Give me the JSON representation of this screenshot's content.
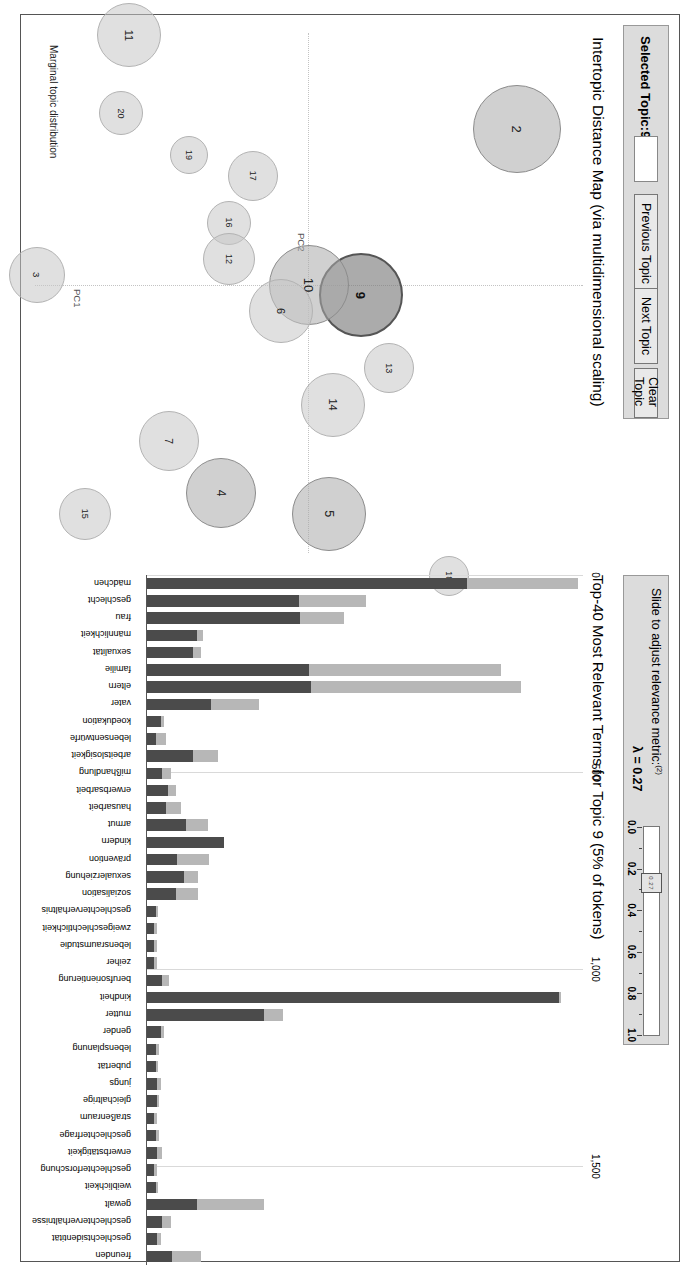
{
  "window": {
    "title": "LDAvis Topic Model Visualization"
  },
  "controls": {
    "selected_topic_label": "Selected Topic:",
    "selected_topic_value": "9",
    "topic_input_value": "",
    "previous_topic_label": "Previous Topic",
    "next_topic_label": "Next Topic",
    "clear_topic_label": "Clear Topic",
    "slider_title": "Slide to adjust relevance metric:",
    "slider_superscript": "(2)",
    "lambda_label": "λ = 0.27",
    "lambda_value": 0.27,
    "slider_ticks": [
      "0.0",
      "0.2",
      "0.4",
      "0.6",
      "0.8",
      "1.0"
    ],
    "slider_min": 0.0,
    "slider_max": 1.0,
    "slider_handle_text": "0.27"
  },
  "map_panel": {
    "title": "Intertopic Distance Map (via multidimensional scaling)",
    "axis_x_label": "PC1",
    "axis_y_label": "PC2",
    "legend_label": "Marginal topic distribution"
  },
  "bar_panel": {
    "title": "Top-40 Most Relevant Terms for Topic 9 (5% of tokens)",
    "topic_number": 9,
    "token_share": "5%",
    "axis_ticks": [
      "0",
      "500",
      "1,000",
      "1,500"
    ]
  },
  "chart_data": [
    {
      "type": "scatter",
      "title": "Intertopic Distance Map (via multidimensional scaling)",
      "xlabel": "PC1",
      "ylabel": "PC2",
      "selected": 9,
      "points": [
        {
          "id": 2,
          "x": -0.3,
          "y": 0.52,
          "r": 44,
          "selected": false
        },
        {
          "id": 13,
          "x": 0.16,
          "y": 0.2,
          "r": 25,
          "selected": false
        },
        {
          "id": 9,
          "x": 0.02,
          "y": 0.13,
          "r": 42,
          "selected": true
        },
        {
          "id": 14,
          "x": 0.23,
          "y": 0.06,
          "r": 32,
          "selected": false
        },
        {
          "id": 5,
          "x": 0.44,
          "y": 0.05,
          "r": 37,
          "selected": false
        },
        {
          "id": 10,
          "x": 0.0,
          "y": 0.0,
          "r": 40,
          "selected": false
        },
        {
          "id": 6,
          "x": 0.05,
          "y": -0.07,
          "r": 32,
          "selected": false
        },
        {
          "id": 17,
          "x": -0.21,
          "y": -0.14,
          "r": 25,
          "selected": false
        },
        {
          "id": 16,
          "x": -0.12,
          "y": -0.2,
          "r": 22,
          "selected": false
        },
        {
          "id": 12,
          "x": -0.05,
          "y": -0.2,
          "r": 26,
          "selected": false
        },
        {
          "id": 4,
          "x": 0.4,
          "y": -0.22,
          "r": 35,
          "selected": false
        },
        {
          "id": 19,
          "x": -0.25,
          "y": -0.3,
          "r": 19,
          "selected": false
        },
        {
          "id": 7,
          "x": 0.3,
          "y": -0.35,
          "r": 30,
          "selected": false
        },
        {
          "id": 11,
          "x": -0.48,
          "y": -0.45,
          "r": 32,
          "selected": false
        },
        {
          "id": 20,
          "x": -0.33,
          "y": -0.47,
          "r": 22,
          "selected": false
        },
        {
          "id": 18,
          "x": 0.56,
          "y": 0.35,
          "r": 20,
          "selected": false
        },
        {
          "id": 15,
          "x": 0.44,
          "y": -0.56,
          "r": 26,
          "selected": false
        },
        {
          "id": 3,
          "x": -0.02,
          "y": -0.68,
          "r": 28,
          "selected": false
        }
      ]
    },
    {
      "type": "bar",
      "title": "Top-40 Most Relevant Terms for Topic 9 (5% of tokens)",
      "xlabel": "",
      "ylabel": "",
      "xlim": [
        0,
        1750
      ],
      "orientation": "horizontal-labels-rotated",
      "categories": [
        "mädchen",
        "geschlecht",
        "frau",
        "männlichkeit",
        "sexualität",
        "familie",
        "eltern",
        "vater",
        "koedukation",
        "lebensentwürfe",
        "arbeitslosigkeit",
        "mißhandlung",
        "erwerbsarbeit",
        "hausarbeit",
        "armut",
        "kindern",
        "prävention",
        "sexualerziehung",
        "sozialisation",
        "geschlechterverhältnis",
        "zweigeschlechtlichkeit",
        "lebensraumstudie",
        "zeiher",
        "berufsorientierung",
        "kindheit",
        "mutter",
        "gender",
        "lebensplanung",
        "pubertät",
        "jungs",
        "gleichaltrige",
        "straßenraum",
        "geschlechterfrage",
        "erwerbstätigkeit",
        "geschlechterforschung",
        "weiblichkeit",
        "gewalt",
        "geschlechterverhältnisse",
        "geschlechtsidentität",
        "freunden"
      ],
      "series": [
        {
          "name": "Overall term frequency",
          "color": "#b7b7b7",
          "values": [
            1730,
            880,
            790,
            225,
            215,
            1420,
            1500,
            450,
            70,
            75,
            285,
            95,
            115,
            135,
            245,
            215,
            250,
            205,
            205,
            45,
            40,
            40,
            40,
            90,
            1660,
            545,
            70,
            50,
            45,
            55,
            50,
            40,
            50,
            60,
            40,
            45,
            470,
            95,
            55,
            215
          ]
        },
        {
          "name": "Estimated term frequency within the selected topic",
          "color": "#4b4b4b",
          "values": [
            1285,
            610,
            615,
            200,
            185,
            650,
            660,
            255,
            55,
            35,
            185,
            60,
            85,
            75,
            155,
            310,
            120,
            150,
            115,
            35,
            30,
            30,
            30,
            60,
            1655,
            470,
            55,
            35,
            35,
            40,
            40,
            30,
            35,
            40,
            30,
            35,
            200,
            60,
            40,
            100
          ]
        }
      ]
    }
  ]
}
